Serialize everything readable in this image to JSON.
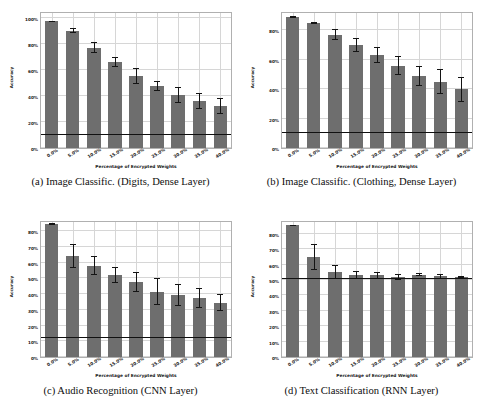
{
  "figure": {
    "bar_color": "#6e6e6e",
    "baseline_color": "#111111",
    "grid_color": "#d6d6d6",
    "axis_color": "#b0b0b0"
  },
  "panels": [
    {
      "key": "a",
      "caption": "(a) Image Classific. (Digits, Dense Layer)",
      "chart_data": {
        "type": "bar",
        "title": "(a) Image Classific. (Digits, Dense Layer)",
        "xlabel": "Percentage of Encrypted Weights",
        "ylabel": "Accuracy",
        "categories": [
          "0.0%",
          "5.0%",
          "10.0%",
          "15.0%",
          "20.0%",
          "25.0%",
          "30.0%",
          "35.0%",
          "40.0%"
        ],
        "values": [
          97.0,
          90.0,
          77.0,
          66.0,
          55.0,
          47.5,
          40.5,
          36.0,
          32.0
        ],
        "errors": [
          0.5,
          2.0,
          4.0,
          4.0,
          6.0,
          4.0,
          6.0,
          6.0,
          6.0
        ],
        "baseline": 10.0,
        "ylim": [
          0,
          105
        ],
        "yticks": [
          0,
          20,
          40,
          60,
          80,
          100
        ],
        "ytick_labels": [
          "0%",
          "20%",
          "40%",
          "60%",
          "80%",
          "100%"
        ],
        "grid": true,
        "legend": "none"
      }
    },
    {
      "key": "b",
      "caption": "(b) Image Classific. (Clothing, Dense Layer)",
      "chart_data": {
        "type": "bar",
        "title": "(b) Image Classific. (Clothing, Dense Layer)",
        "xlabel": "Percentage of Encrypted Weights",
        "ylabel": "Accuracy",
        "categories": [
          "0.0%",
          "5.0%",
          "10.0%",
          "15.0%",
          "20.0%",
          "25.0%",
          "30.0%",
          "35.0%",
          "40.0%"
        ],
        "values": [
          89.0,
          85.0,
          77.0,
          70.0,
          63.0,
          56.0,
          49.0,
          45.0,
          40.0
        ],
        "errors": [
          0.6,
          0.8,
          3.5,
          4.5,
          5.5,
          6.5,
          7.0,
          8.5,
          8.5
        ],
        "baseline": 10.0,
        "ylim": [
          0,
          93
        ],
        "yticks": [
          0,
          20,
          40,
          60,
          80
        ],
        "ytick_labels": [
          "0%",
          "20%",
          "40%",
          "60%",
          "80%"
        ],
        "grid": true,
        "legend": "none"
      }
    },
    {
      "key": "c",
      "caption": "(c) Audio Recognition (CNN Layer)",
      "chart_data": {
        "type": "bar",
        "title": "(c) Audio Recognition (CNN Layer)",
        "xlabel": "Percentage of Encrypted Weights",
        "ylabel": "Accuracy",
        "categories": [
          "0.0%",
          "5.0%",
          "10.0%",
          "15.0%",
          "20.0%",
          "25.0%",
          "30.0%",
          "35.0%",
          "40.0%"
        ],
        "values": [
          84.5,
          64.0,
          58.0,
          52.0,
          47.5,
          41.5,
          39.5,
          37.5,
          34.5
        ],
        "errors": [
          0.5,
          7.5,
          6.0,
          5.0,
          6.5,
          8.5,
          7.0,
          6.5,
          5.5
        ],
        "baseline": 12.0,
        "ylim": [
          0,
          87
        ],
        "yticks": [
          0,
          10,
          20,
          30,
          40,
          50,
          60,
          70,
          80
        ],
        "ytick_labels": [
          "0%",
          "10%",
          "20%",
          "30%",
          "40%",
          "50%",
          "60%",
          "70%",
          "80%"
        ],
        "grid": true,
        "legend": "none"
      }
    },
    {
      "key": "d",
      "caption": "(d) Text Classification (RNN Layer)",
      "chart_data": {
        "type": "bar",
        "title": "(d) Text Classification (RNN Layer)",
        "xlabel": "Percentage of Encrypted Weights",
        "ylabel": "Accuracy",
        "categories": [
          "0.0%",
          "5.0%",
          "10.0%",
          "15.0%",
          "20.0%",
          "25.0%",
          "30.0%",
          "35.0%",
          "40.0%"
        ],
        "values": [
          85.5,
          65.0,
          55.5,
          53.5,
          53.0,
          52.0,
          53.5,
          52.5,
          52.0
        ],
        "errors": [
          0.4,
          8.5,
          4.5,
          2.5,
          2.5,
          2.0,
          1.0,
          1.5,
          0.8
        ],
        "baseline": 50.5,
        "ylim": [
          0,
          89
        ],
        "yticks": [
          0,
          10,
          20,
          30,
          40,
          50,
          60,
          70,
          80
        ],
        "ytick_labels": [
          "0%",
          "10%",
          "20%",
          "30%",
          "40%",
          "50%",
          "60%",
          "70%",
          "80%"
        ],
        "grid": true,
        "legend": "none"
      }
    }
  ]
}
